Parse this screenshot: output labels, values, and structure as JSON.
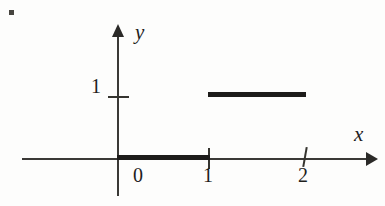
{
  "chart_data": {
    "type": "line",
    "title": "",
    "subtitle": "",
    "xlabel": "x",
    "ylabel": "y",
    "xlim": [
      -1.0,
      2.6
    ],
    "ylim": [
      -0.35,
      1.45
    ],
    "grid": false,
    "legend": null,
    "x_ticks": [
      "0",
      "1",
      "2"
    ],
    "x_tick_values": [
      0,
      1,
      2
    ],
    "y_ticks": [
      "1"
    ],
    "y_tick_values": [
      1
    ],
    "series": [
      {
        "name": "step-segment-lower",
        "x": [
          0,
          1
        ],
        "y": [
          0,
          0
        ],
        "style": "thick solid"
      },
      {
        "name": "step-segment-upper",
        "x": [
          1,
          2
        ],
        "y": [
          1,
          1
        ],
        "style": "thick solid"
      }
    ]
  },
  "axes": {
    "x_axis_name": "x",
    "y_axis_name": "y",
    "x_tick_labels": [
      {
        "text": "0",
        "value": 0
      },
      {
        "text": "1",
        "value": 1
      },
      {
        "text": "2",
        "value": 2
      }
    ],
    "y_tick_labels": [
      {
        "text": "1",
        "value": 1
      }
    ]
  },
  "marks": {
    "corner_mark": "bullet-dot"
  },
  "colors": {
    "ink": "#2b2a28",
    "ink_bold": "#1d1c1a",
    "axis": "#3a3936",
    "background": "#fdfdfc"
  }
}
